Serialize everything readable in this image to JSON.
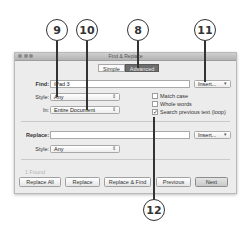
{
  "callouts": [
    {
      "number": "9",
      "target": "find-style-select"
    },
    {
      "number": "10",
      "target": "search-in-select"
    },
    {
      "number": "8",
      "target": "advanced-tab"
    },
    {
      "number": "11",
      "target": "find-insert-button"
    },
    {
      "number": "12",
      "target": "search-previous-checkbox"
    }
  ],
  "window": {
    "title": "Find & Replace",
    "tabs": [
      {
        "label": "Simple",
        "active": false
      },
      {
        "label": "Advanced",
        "active": true
      }
    ]
  },
  "find": {
    "label": "Find:",
    "value": "iPad 3",
    "insert_label": "Insert...",
    "insert_arrow": "▾",
    "style_label": "Style:",
    "style_value": "Any",
    "in_label": "In:",
    "in_value": "Entire Document",
    "select_arrow": "⇕"
  },
  "options": [
    {
      "label": "Match case",
      "checked": false
    },
    {
      "label": "Whole words",
      "checked": false
    },
    {
      "label": "Search previous text (loop)",
      "checked": true
    }
  ],
  "replace": {
    "label": "Replace:",
    "value": "",
    "insert_label": "Insert...",
    "insert_arrow": "▾",
    "style_label": "Style:",
    "style_value": "Any",
    "select_arrow": "⇕"
  },
  "status": {
    "found_text": "1 Found"
  },
  "buttons": {
    "replace_all": "Replace All",
    "replace": "Replace",
    "replace_find": "Replace & Find",
    "previous": "Previous",
    "next": "Next"
  },
  "check_glyph": "✓"
}
